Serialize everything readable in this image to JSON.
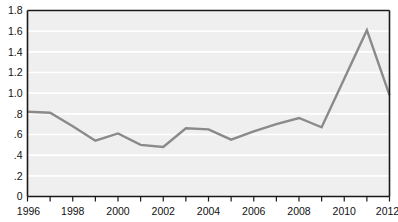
{
  "chart_data": {
    "type": "line",
    "title": "",
    "subtitle": "",
    "xlabel": "",
    "ylabel": "",
    "x": [
      1996,
      1997,
      1998,
      1999,
      2000,
      2001,
      2002,
      2003,
      2004,
      2005,
      2006,
      2007,
      2008,
      2009,
      2010,
      2011,
      2012
    ],
    "values": [
      0.82,
      0.81,
      0.68,
      0.54,
      0.61,
      0.5,
      0.48,
      0.66,
      0.65,
      0.55,
      0.63,
      0.7,
      0.76,
      0.67,
      1.14,
      1.61,
      0.98
    ],
    "series": [
      {
        "name": "value",
        "values": [
          0.82,
          0.81,
          0.68,
          0.54,
          0.61,
          0.5,
          0.48,
          0.66,
          0.65,
          0.55,
          0.63,
          0.7,
          0.76,
          0.67,
          1.14,
          1.61,
          0.98
        ]
      }
    ],
    "xlim": [
      1996,
      2012
    ],
    "ylim": [
      0,
      1.8
    ],
    "ytick_values": [
      0,
      0.2,
      0.4,
      0.6,
      0.8,
      1.0,
      1.2,
      1.4,
      1.6,
      1.8
    ],
    "ytick_labels": [
      "0",
      ".2",
      ".4",
      ".6",
      ".8",
      "1.0",
      "1.2",
      "1.4",
      "1.6",
      "1.8"
    ],
    "xtick_values": [
      1996,
      1997,
      1998,
      1999,
      2000,
      2001,
      2002,
      2003,
      2004,
      2005,
      2006,
      2007,
      2008,
      2009,
      2010,
      2011,
      2012
    ],
    "xtick_labels_shown": [
      "1996",
      "1998",
      "2000",
      "2002",
      "2004",
      "2006",
      "2008",
      "2010",
      "2012"
    ],
    "grid": "horizontal",
    "legend": "none",
    "colors": {
      "line": "#8a8a8a",
      "plot_background": "#efefef",
      "gridline": "#ffffff",
      "axis": "#1a1a1a",
      "text": "#111111",
      "figure_background": "#ffffff"
    }
  }
}
